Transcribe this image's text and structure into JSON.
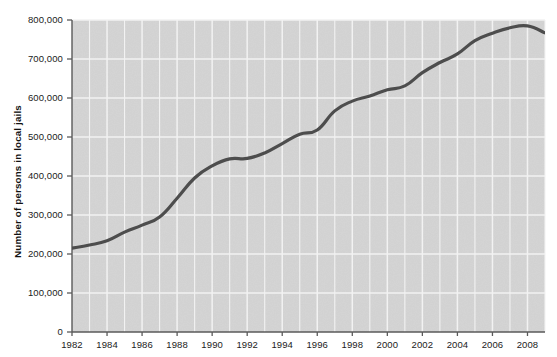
{
  "chart_data": {
    "type": "line",
    "title": "",
    "subtitle": "",
    "xlabel": "",
    "ylabel": "Number of persons in local jails",
    "xlim": [
      1982,
      1983.5
    ],
    "ylim": [
      0,
      800000
    ],
    "grid": true,
    "legend": null,
    "legend_position": "none",
    "x_tick_labels": [
      "1982",
      "1984",
      "1986",
      "1988",
      "1990",
      "1992",
      "1994",
      "1996",
      "1998",
      "2000",
      "2002",
      "2004",
      "2006",
      "2008"
    ],
    "x_tick_values": [
      1982,
      1984,
      1986,
      1988,
      1990,
      1992,
      1994,
      1996,
      1998,
      2000,
      2002,
      2004,
      2006,
      2008
    ],
    "y_tick_labels": [
      "0",
      "100,000",
      "200,000",
      "300,000",
      "400,000",
      "500,000",
      "600,000",
      "700,000",
      "800,000"
    ],
    "y_tick_values": [
      0,
      100000,
      200000,
      300000,
      400000,
      500000,
      600000,
      700000,
      800000
    ],
    "x": [
      1982,
      1983,
      1984,
      1985,
      1986,
      1987,
      1988,
      1989,
      1990,
      1991,
      1992,
      1993,
      1994,
      1995,
      1996,
      1997,
      1998,
      1999,
      2000,
      2001,
      2002,
      2003,
      2004,
      2005,
      2006,
      2007,
      2008,
      2009
    ],
    "values": [
      215000,
      223000,
      234000,
      256000,
      274000,
      295000,
      343000,
      395000,
      426000,
      444000,
      445000,
      459000,
      483000,
      507000,
      518000,
      567000,
      592000,
      605000,
      621000,
      631000,
      665000,
      691000,
      713000,
      747000,
      766000,
      780000,
      785000,
      767000
    ],
    "series": [
      {
        "name": "Persons in local jails",
        "color": "#4d4d4d",
        "values": [
          215000,
          223000,
          234000,
          256000,
          274000,
          295000,
          343000,
          395000,
          426000,
          444000,
          445000,
          459000,
          483000,
          507000,
          518000,
          567000,
          592000,
          605000,
          621000,
          631000,
          665000,
          691000,
          713000,
          747000,
          766000,
          780000,
          785000,
          767000
        ]
      }
    ],
    "plot_background_color": "#d4d4d4",
    "grid_color": "#f2f2f2",
    "axis_color": "#5a5a5a",
    "line_color": "#4d4d4d",
    "line_width": 3.2
  },
  "layout": {
    "plot_left": 72,
    "plot_right": 545,
    "plot_top": 20,
    "plot_bottom": 332
  }
}
